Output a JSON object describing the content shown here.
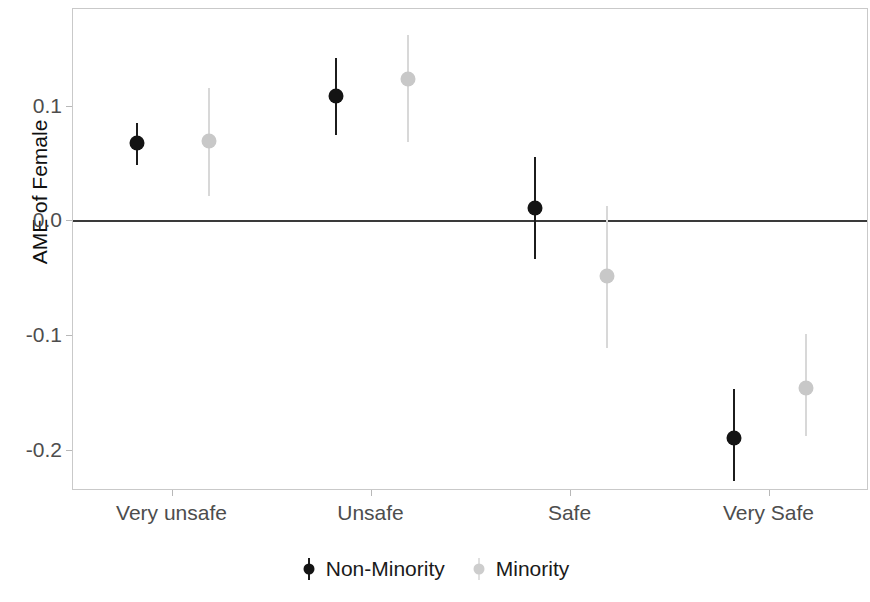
{
  "chart_data": {
    "type": "scatter",
    "title": "",
    "subtitle": "",
    "xlabel": "",
    "ylabel": "AME of Female",
    "categories": [
      "Very unsafe",
      "Unsafe",
      "Safe",
      "Very Safe"
    ],
    "ylim": [
      -0.235,
      0.185
    ],
    "yticks": [
      0.1,
      0.0,
      -0.1,
      -0.2
    ],
    "ytick_labels": [
      "0.1",
      "0.0",
      "-0.1",
      "-0.2"
    ],
    "grid": false,
    "reference_line": 0.0,
    "legend_position": "bottom",
    "series": [
      {
        "name": "Non-Minority",
        "color": "#141414",
        "values": [
          0.068,
          0.109,
          0.012,
          -0.189
        ],
        "ci_low": [
          0.049,
          0.075,
          -0.033,
          -0.226
        ],
        "ci_high": [
          0.086,
          0.142,
          0.056,
          -0.146
        ]
      },
      {
        "name": "Minority",
        "color": "#c8c8c8",
        "values": [
          0.07,
          0.124,
          -0.048,
          -0.145
        ],
        "ci_low": [
          0.022,
          0.069,
          -0.11,
          -0.187
        ],
        "ci_high": [
          0.116,
          0.162,
          0.013,
          -0.098
        ]
      }
    ]
  },
  "legend": {
    "items": [
      {
        "label": "Non-Minority",
        "key": "nonminority"
      },
      {
        "label": "Minority",
        "key": "minority"
      }
    ]
  }
}
